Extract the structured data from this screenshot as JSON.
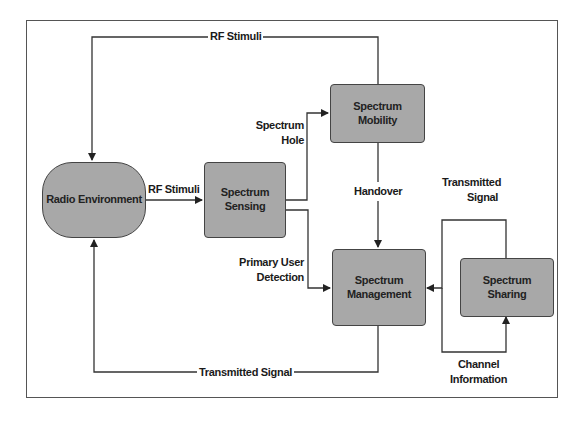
{
  "diagram": {
    "type": "cognitive-radio-cycle",
    "nodes": {
      "radio_environment": "Radio Environment",
      "spectrum_sensing_line1": "Spectrum",
      "spectrum_sensing_line2": "Sensing",
      "spectrum_mobility_line1": "Spectrum",
      "spectrum_mobility_line2": "Mobility",
      "spectrum_management_line1": "Spectrum",
      "spectrum_management_line2": "Management",
      "spectrum_sharing_line1": "Spectrum",
      "spectrum_sharing_line2": "Sharing"
    },
    "edges": {
      "rf_stimuli_top": "RF Stimuli",
      "rf_stimuli_mid": "RF Stimuli",
      "spectrum_hole_line1": "Spectrum",
      "spectrum_hole_line2": "Hole",
      "handover": "Handover",
      "primary_user_line1": "Primary User",
      "primary_user_line2": "Detection",
      "transmitted_signal_bottom": "Transmitted Signal",
      "transmitted_signal_right_line1": "Transmitted",
      "transmitted_signal_right_line2": "Signal",
      "channel_information_line1": "Channel",
      "channel_information_line2": "Information"
    },
    "colors": {
      "node_fill": "#a8a8a8",
      "node_border": "#444444",
      "line": "#333333",
      "background": "#ffffff"
    }
  }
}
